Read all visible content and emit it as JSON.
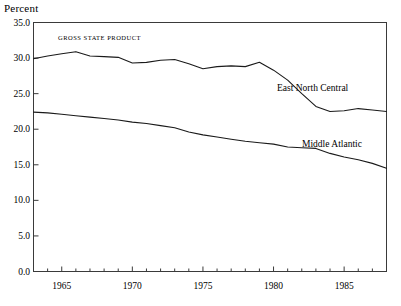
{
  "chart_data": {
    "type": "line",
    "title": "",
    "annotation": "GROSS STATE PRODUCT",
    "ylabel": "Percent",
    "xlabel": "",
    "ylim": [
      0.0,
      35.0
    ],
    "xlim": [
      1963,
      1988
    ],
    "grid": false,
    "legend_position": "inline-right",
    "yticks": [
      "0.0",
      "5.0",
      "10.0",
      "15.0",
      "20.0",
      "25.0",
      "30.0",
      "35.0"
    ],
    "ytick_values": [
      0.0,
      5.0,
      10.0,
      15.0,
      20.0,
      25.0,
      30.0,
      35.0
    ],
    "xticks": [
      "1965",
      "1970",
      "1975",
      "1980",
      "1985"
    ],
    "xtick_values": [
      1965,
      1970,
      1975,
      1980,
      1985
    ],
    "x": [
      1963,
      1964,
      1965,
      1966,
      1967,
      1968,
      1969,
      1970,
      1971,
      1972,
      1973,
      1974,
      1975,
      1976,
      1977,
      1978,
      1979,
      1980,
      1981,
      1982,
      1983,
      1984,
      1985,
      1986,
      1987,
      1988
    ],
    "series": [
      {
        "name": "East North Central",
        "color": "#1a1a1a",
        "values": [
          29.9,
          30.3,
          30.6,
          30.9,
          30.3,
          30.2,
          30.1,
          29.3,
          29.4,
          29.7,
          29.8,
          29.2,
          28.5,
          28.8,
          28.9,
          28.8,
          29.4,
          28.3,
          26.9,
          25.0,
          23.2,
          22.5,
          22.6,
          22.9,
          22.7,
          22.5
        ]
      },
      {
        "name": "Middle Atlantic",
        "color": "#1a1a1a",
        "values": [
          22.4,
          22.3,
          22.1,
          21.9,
          21.7,
          21.5,
          21.3,
          21.0,
          20.8,
          20.5,
          20.2,
          19.6,
          19.2,
          18.9,
          18.6,
          18.3,
          18.1,
          17.9,
          17.5,
          17.4,
          17.3,
          16.6,
          16.1,
          15.7,
          15.2,
          14.5
        ]
      }
    ]
  },
  "labels": {
    "east_north_central": "East North Central",
    "middle_atlantic": "Middle Atlantic"
  }
}
